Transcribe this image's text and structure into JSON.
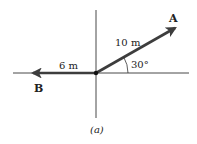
{
  "figure": {
    "caption": "(a)",
    "colors": {
      "axis": "#333333",
      "vector": "#3d3d3d",
      "text": "#222222",
      "background": "#ffffff"
    },
    "vectors": [
      {
        "name": "A",
        "label": "A",
        "magnitude_label": "10 m",
        "magnitude": 10,
        "unit": "m",
        "angle_deg": 30,
        "angle_label": "30°"
      },
      {
        "name": "B",
        "label": "B",
        "magnitude_label": "6 m",
        "magnitude": 6,
        "unit": "m",
        "angle_deg": 180
      }
    ]
  }
}
